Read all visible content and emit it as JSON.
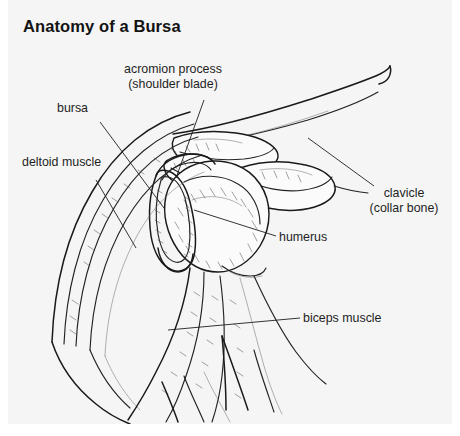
{
  "figure": {
    "title": "Anatomy of a Bursa",
    "background_color": "#f5f5f5",
    "page_color": "#ffffff",
    "ink_color": "#1a1a1a"
  },
  "labels": {
    "acromion": {
      "line1": "acromion process",
      "line2": "(shoulder blade)"
    },
    "bursa": "bursa",
    "deltoid": "deltoid muscle",
    "clavicle": {
      "line1": "clavicle",
      "line2": "(collar bone)"
    },
    "humerus": "humerus",
    "biceps": "biceps muscle"
  }
}
